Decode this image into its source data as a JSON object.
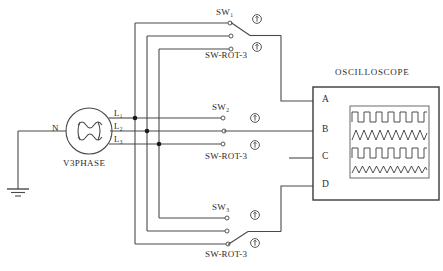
{
  "diagram": {
    "title_source": "V3PHASE",
    "title_scope": "OSCILLOSCOPE",
    "neutral_label": "N",
    "ground_icon": "earth-ground-icon",
    "source_icon": "three-phase-generator-icon",
    "phase_lines": [
      {
        "id": "l1",
        "label": "L",
        "sub": "1"
      },
      {
        "id": "l2",
        "label": "L",
        "sub": "2"
      },
      {
        "id": "l3",
        "label": "L",
        "sub": "3"
      }
    ],
    "switches": [
      {
        "id": "sw-top",
        "name": "SW",
        "sub": "1",
        "type_label": "SW-ROT-3",
        "closed_pole": 1,
        "actuator_icon": "rotary-actuator-icon",
        "actuators": 2
      },
      {
        "id": "sw-mid",
        "name": "SW",
        "sub": "2",
        "type_label": "SW-ROT-3",
        "closed_pole": 0,
        "actuator_icon": "rotary-actuator-icon",
        "actuators": 2
      },
      {
        "id": "sw-bot",
        "name": "SW",
        "sub": "3",
        "type_label": "SW-ROT-3",
        "closed_pole": 3,
        "actuator_icon": "rotary-actuator-icon",
        "actuators": 2
      }
    ],
    "scope_terminals": [
      "A",
      "B",
      "C",
      "D"
    ],
    "waveforms": [
      {
        "id": "trace-1",
        "type": "square",
        "cycles": 6
      },
      {
        "id": "trace-2",
        "type": "triangle",
        "cycles": 9
      },
      {
        "id": "trace-3",
        "type": "square",
        "cycles": 6
      },
      {
        "id": "trace-4",
        "type": "triangle",
        "cycles": 10
      }
    ],
    "colors": {
      "wire": "#4a4a4a",
      "outline": "#3a3a3a",
      "text": "#2b2b2b",
      "node": "#1a1a1a",
      "background": "#ffffff"
    }
  }
}
